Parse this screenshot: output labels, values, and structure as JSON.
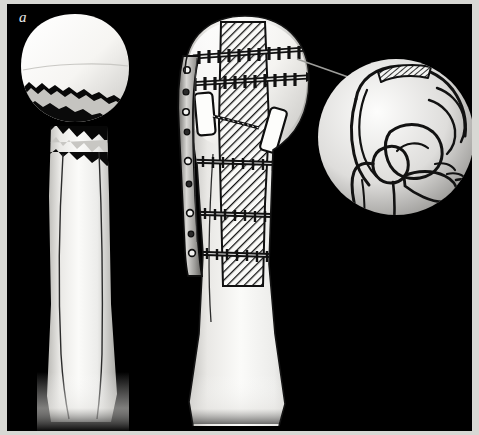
{
  "figure": {
    "panel_label": "a",
    "background_color": "#000000",
    "frame_color": "#d8d8d4",
    "bone_color": "#f2f1ee",
    "outline_color": "#111111",
    "hatch_color": "#1a1a1a"
  },
  "panels": {
    "left": {
      "name": "Displaced proximal humerus fracture",
      "description": "Humerus with displaced two-part fracture; jagged fracture lines separate the humeral head from the shaft",
      "parts": [
        {
          "name": "humeral-head",
          "note": "rounded articular head with intact surface"
        },
        {
          "name": "fracture-gap",
          "note": "black gap between head fragment and shaft"
        },
        {
          "name": "humeral-shaft",
          "note": "long diaphysis with cortical lines"
        }
      ]
    },
    "center": {
      "name": "Reconstructed humerus with plate, screws and intramedullary strut graft",
      "description": "Same humerus after open reduction: lateral plate on the medial/left border, transverse cortical screws, and a hatched intramedullary cortical strut graft",
      "parts": [
        {
          "name": "lateral-plate",
          "note": "long contoured metal plate with round screw holes"
        },
        {
          "name": "head-screws",
          "note": "two long threaded screws crossing the humeral head"
        },
        {
          "name": "strut-graft",
          "note": "hatched intramedullary cortical strut graft column"
        },
        {
          "name": "graft-blocks",
          "note": "two white rectangular cancellous graft blocks"
        },
        {
          "name": "shaft-screws",
          "note": "three transverse screws fixing plate, shaft and graft"
        }
      ]
    },
    "inset": {
      "name": "Iliac crest graft donor site",
      "description": "Circular magnified view of the hemipelvis and hip joint; the hatched strip along the iliac crest marks the graft harvest site",
      "parts": [
        {
          "name": "ilium",
          "note": "iliac wing"
        },
        {
          "name": "iliac-crest-donor-hatch",
          "note": "hatched graft harvest strip on crest"
        },
        {
          "name": "acetabulum",
          "note": "hip socket"
        },
        {
          "name": "femoral-head-and-neck",
          "note": "proximal femur"
        },
        {
          "name": "pubis-ischium",
          "note": "anterior pelvic ring"
        }
      ]
    },
    "leader": {
      "name": "Leader line connecting the humeral graft to the iliac donor site"
    }
  }
}
